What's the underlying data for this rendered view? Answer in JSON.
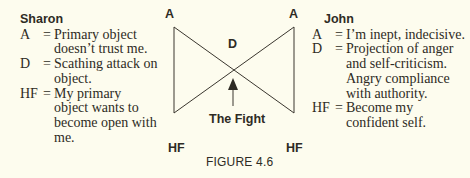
{
  "figure": {
    "caption": "FIGURE 4.6",
    "diagram": {
      "top_left_label": "A",
      "top_right_label": "A",
      "center_label": "D",
      "bottom_left_label": "HF",
      "bottom_right_label": "HF",
      "arrow_label": "The Fight",
      "line_color": "#3a362e"
    }
  },
  "left_legend": {
    "title": "Sharon",
    "items": [
      {
        "key": "A",
        "eq": "=",
        "lines": [
          "Primary object",
          "doesn’t trust me."
        ]
      },
      {
        "key": "D",
        "eq": "=",
        "lines": [
          "Scathing attack on",
          "object."
        ]
      },
      {
        "key": "HF",
        "eq": "=",
        "lines": [
          "My primary",
          "object wants to",
          "become open with",
          "me."
        ]
      }
    ]
  },
  "right_legend": {
    "title": "John",
    "items": [
      {
        "key": "A",
        "eq": "=",
        "lines": [
          "I’m inept, indecisive."
        ]
      },
      {
        "key": "D",
        "eq": "=",
        "lines": [
          "Projection of anger",
          "and self-criticism.",
          "Angry compliance",
          "with authority."
        ]
      },
      {
        "key": "HF",
        "eq": "=",
        "lines": [
          "Become my",
          "confident self."
        ]
      }
    ]
  },
  "colors": {
    "background": "#fdfcee",
    "text": "#2e2b24"
  }
}
